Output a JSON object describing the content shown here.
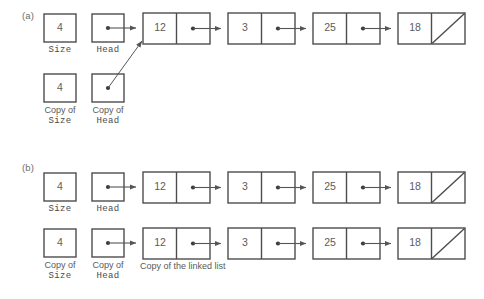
{
  "figure": {
    "panels": [
      {
        "key": "a",
        "label": "(a)",
        "description": "shallow copy - copy of Head points at the original list",
        "variables": [
          {
            "name": "size-box",
            "value": "4",
            "caption_plain": "",
            "caption_mono": "Size"
          },
          {
            "name": "head-box",
            "value": "•",
            "caption_plain": "",
            "caption_mono": "Head"
          },
          {
            "name": "copy-of-size-box",
            "value": "4",
            "caption_plain": "Copy of",
            "caption_mono": "Size"
          },
          {
            "name": "copy-of-head-box",
            "value": "•",
            "caption_plain": "Copy of",
            "caption_mono": "Head"
          }
        ],
        "list": {
          "name": "original-linked-list",
          "nodes": [
            {
              "value": "12",
              "next": "pointer"
            },
            {
              "value": "3",
              "next": "pointer"
            },
            {
              "value": "25",
              "next": "pointer"
            },
            {
              "value": "18",
              "next": "null"
            }
          ]
        },
        "caption": ""
      },
      {
        "key": "b",
        "label": "(b)",
        "description": "deep copy - copy of Head points at a duplicated list",
        "variables": [
          {
            "name": "size-box",
            "value": "4",
            "caption_plain": "",
            "caption_mono": "Size"
          },
          {
            "name": "head-box",
            "value": "•",
            "caption_plain": "",
            "caption_mono": "Head"
          },
          {
            "name": "copy-of-size-box",
            "value": "4",
            "caption_plain": "Copy of",
            "caption_mono": "Size"
          },
          {
            "name": "copy-of-head-box",
            "value": "•",
            "caption_plain": "Copy of",
            "caption_mono": "Head"
          }
        ],
        "list": {
          "name": "original-linked-list",
          "nodes": [
            {
              "value": "12",
              "next": "pointer"
            },
            {
              "value": "3",
              "next": "pointer"
            },
            {
              "value": "25",
              "next": "pointer"
            },
            {
              "value": "18",
              "next": "null"
            }
          ]
        },
        "list_copy": {
          "name": "copied-linked-list",
          "nodes": [
            {
              "value": "12",
              "next": "pointer"
            },
            {
              "value": "3",
              "next": "pointer"
            },
            {
              "value": "25",
              "next": "pointer"
            },
            {
              "value": "18",
              "next": "null"
            }
          ]
        },
        "caption": "Copy of the linked list"
      }
    ]
  },
  "colors": {
    "stroke": "#4d4d4d",
    "text": "#5a5a5a",
    "background": "#ffffff",
    "arrow": "#555555"
  },
  "text": {
    "panel_a_label": "(a)",
    "panel_b_label": "(b)",
    "size_label": "Size",
    "head_label": "Head",
    "copy_of": "Copy of",
    "copy_caption": "Copy of the linked list",
    "val_size": "4",
    "node_1": "12",
    "node_2": "3",
    "node_3": "25",
    "node_4": "18"
  }
}
